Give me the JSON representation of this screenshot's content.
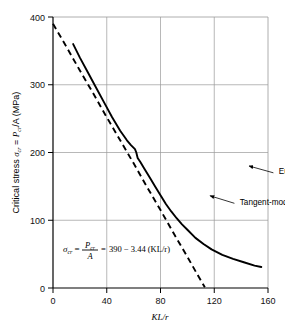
{
  "chart_data": {
    "type": "line",
    "title": "",
    "xlabel": "KL/r",
    "ylabel": "Critical stress σcr = Pcr/A (MPa)",
    "xlim": [
      0,
      160
    ],
    "ylim": [
      0,
      400
    ],
    "xticks": [
      "0",
      "40",
      "80",
      "120",
      "160"
    ],
    "xtick_values": [
      0,
      40,
      80,
      120,
      160
    ],
    "yticks": [
      "0",
      "100",
      "200",
      "300",
      "400"
    ],
    "ytick_values": [
      0,
      100,
      200,
      300,
      400
    ],
    "grid": true,
    "grid_color": "#9a9a9a",
    "legend_position": "inline-annotations",
    "series": [
      {
        "name": "Tangent-modulus curve",
        "style": "solid",
        "color": "#000000",
        "x": [
          15,
          20,
          26,
          32,
          38,
          44,
          50,
          55,
          58,
          61,
          62,
          63,
          65,
          68,
          72,
          76,
          80,
          84,
          88,
          92,
          96,
          100,
          106,
          112,
          118,
          126,
          134,
          142,
          150,
          155
        ],
        "y": [
          360,
          340,
          318,
          296,
          274,
          252,
          232,
          218,
          211,
          205,
          200,
          192,
          186,
          176,
          163,
          150,
          137,
          124,
          113,
          103,
          94,
          86,
          74,
          65,
          57,
          49,
          43,
          38,
          33,
          31
        ]
      },
      {
        "name": "Euler curve",
        "style": "dashed",
        "color": "#000000",
        "x": [
          0,
          10,
          20,
          30,
          40,
          50,
          60,
          70,
          80,
          90,
          100,
          108,
          113
        ],
        "y": [
          390,
          356,
          321,
          287,
          252,
          218,
          184,
          149,
          115,
          80,
          46,
          18,
          1
        ]
      }
    ],
    "annotations": [
      {
        "name": "tangent-modulus-label",
        "text": "Tangent-modulus curve",
        "text_x": 139,
        "text_y": 127,
        "arrow_from_x": 135,
        "arrow_from_y": 125,
        "arrow_to_x": 117,
        "arrow_to_y": 136
      },
      {
        "name": "euler-label",
        "text": "Euler curve",
        "text_x": 168,
        "text_y": 172,
        "arrow_from_x": 164,
        "arrow_from_y": 170,
        "arrow_to_x": 146,
        "arrow_to_y": 180
      },
      {
        "name": "equation-arrow",
        "text": "",
        "arrow_from_x": 196,
        "arrow_from_y": 255,
        "arrow_to_x": 216,
        "arrow_to_y": 243
      }
    ],
    "equation": {
      "sigma": "σ",
      "sigma_sub": "cr",
      "equals1": "=",
      "numerator": "P",
      "numerator_sub": "cr",
      "denominator": "A",
      "equals2": "=",
      "rhs": "390 − 3.44 (KL/r)",
      "full": "σcr = Pcr/A = 390 − 3.44 (KL/r)"
    }
  },
  "axis": {
    "y_label_parts": {
      "prefix": "Critical stress ",
      "sigma": "σ",
      "sigma_sub": "cr",
      "equals": " = ",
      "p": "P",
      "p_sub": "cr",
      "suffix": "/A (MPa)"
    },
    "x_label": "KL/r"
  }
}
